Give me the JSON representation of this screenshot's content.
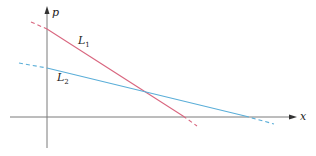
{
  "diagram": {
    "axes": {
      "horizontal_label": "x",
      "vertical_label": "p",
      "axis_color": "#7a7a7a"
    },
    "lines": [
      {
        "name": "L1",
        "label_main": "L",
        "label_sub": "1",
        "color": "#d9667f",
        "slope": "steep negative",
        "dashed_left": [
          [
            31,
            22
          ],
          [
            47,
            29
          ]
        ],
        "solid": [
          [
            47,
            29
          ],
          [
            183,
            116
          ]
        ],
        "dashed_right": [
          [
            183,
            116
          ],
          [
            197,
            126
          ]
        ]
      },
      {
        "name": "L2",
        "label_main": "L",
        "label_sub": "2",
        "color": "#5aaed8",
        "slope": "shallow negative",
        "dashed_left": [
          [
            19,
            63
          ],
          [
            47,
            68
          ]
        ],
        "solid": [
          [
            47,
            68
          ],
          [
            245,
            116
          ]
        ],
        "dashed_right": [
          [
            245,
            116
          ],
          [
            274,
            124
          ]
        ]
      }
    ],
    "intersection": "L1 and L2 cross above the x-axis"
  }
}
